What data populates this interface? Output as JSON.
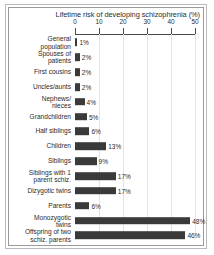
{
  "chart_data": {
    "type": "bar",
    "orientation": "horizontal",
    "title": "Lifetime risk of  developing schizophrenia (%)",
    "xlabel": "",
    "ylabel": "",
    "xlim": [
      0,
      50
    ],
    "xticks": [
      "0",
      "10",
      "20",
      "30",
      "40",
      "50"
    ],
    "grid": true,
    "legend": false,
    "unit": "%",
    "categories": [
      "General\npopulation",
      "Spouses of\npatients",
      "First cousins",
      "Uncles/aunts",
      "Nephews/\nnieces",
      "Grandchildren",
      "Half siblings",
      "Children",
      "Siblings",
      "Siblings with 1\nparent schiz.",
      "Dizygotic twins",
      "Parents",
      "Monozygotic\ntwins",
      "Offspring of two\nschiz. parents"
    ],
    "values": [
      1,
      2,
      2,
      2,
      4,
      5,
      6,
      13,
      9,
      17,
      17,
      6,
      48,
      46
    ],
    "value_labels": [
      "1%",
      "2%",
      "2%",
      "2%",
      "4%",
      "5%",
      "6%",
      "13%",
      "9%",
      "17%",
      "17%",
      "6%",
      "48%",
      "46%"
    ],
    "bar_color": "#3a3a3a",
    "background_color": "#ffffff",
    "axis_color": "#4a4a4a",
    "grid_color": "#e3e3e3",
    "frame_color": "#9a9a9a"
  }
}
